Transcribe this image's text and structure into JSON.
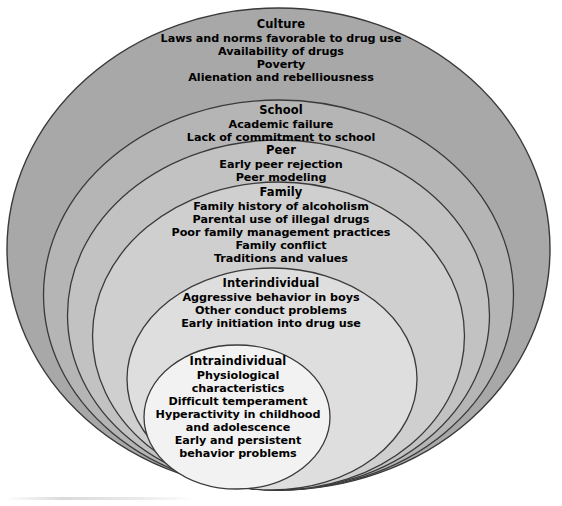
{
  "diagram": {
    "type": "nested-ellipses",
    "background_color": "#ffffff",
    "outline_color": "#3a3a3a",
    "layers": [
      {
        "id": "culture",
        "title": "Culture",
        "fill_color": "#a8a8a8",
        "items": [
          "Laws and norms favorable to drug use",
          "Availability of drugs",
          "Poverty",
          "Alienation and rebelliousness"
        ]
      },
      {
        "id": "school",
        "title": "School",
        "fill_color": "#b5b5b5",
        "items": [
          "Academic failure",
          "Lack of commitment to school"
        ]
      },
      {
        "id": "peer",
        "title": "Peer",
        "fill_color": "#c2c2c2",
        "items": [
          "Early peer rejection",
          "Peer modeling"
        ]
      },
      {
        "id": "family",
        "title": "Family",
        "fill_color": "#cfcfcf",
        "items": [
          "Family history of alcoholism",
          "Parental use of illegal drugs",
          "Poor family management practices",
          "Family conflict",
          "Traditions and values"
        ]
      },
      {
        "id": "interindividual",
        "title": "Interindividual",
        "fill_color": "#dedede",
        "items": [
          "Aggressive behavior in boys",
          "Other conduct problems",
          "Early initiation into drug use"
        ]
      },
      {
        "id": "intraindividual",
        "title": "Intraindividual",
        "fill_color": "#f2f2f2",
        "items": [
          "Physiological characteristics",
          "Difficult temperament",
          "Hyperactivity in childhood and adolescence",
          "Early and persistent behavior problems"
        ]
      }
    ]
  }
}
